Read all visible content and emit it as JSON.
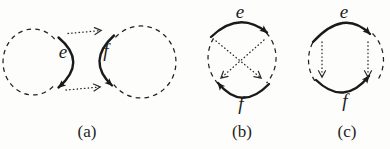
{
  "colors": {
    "ink": "#1d1d1d",
    "background": "#fdfdfc"
  },
  "fig_a": {
    "e_label": "e",
    "f_label": "f",
    "caption": "(a)"
  },
  "fig_b": {
    "e_label": "e",
    "f_label": "f",
    "caption": "(b)"
  },
  "fig_c": {
    "e_label": "e",
    "f_label": "f",
    "caption": "(c)"
  }
}
